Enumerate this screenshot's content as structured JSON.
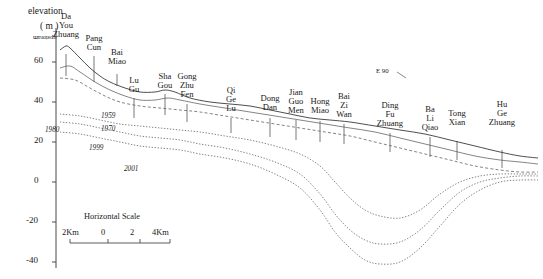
{
  "figure": {
    "type": "hydrogeological-cross-section",
    "axis": {
      "y_title_line1": "elevation",
      "y_title_line2": "( m )",
      "y_ticks": [
        60,
        40,
        20,
        0,
        -20,
        -40
      ],
      "y_tick_labels": [
        "60",
        "40",
        "20",
        "0",
        "-20",
        "-40"
      ],
      "ylim": [
        -45,
        72
      ]
    },
    "upstream_marker": "upstream",
    "annotation": "E 90",
    "scale_bar": {
      "title": "Horizontal Scale",
      "labels": [
        "2Km",
        "0",
        "2",
        "4Km"
      ]
    },
    "sites": [
      {
        "name": "Da\nYou\nZhuang",
        "x": 66,
        "label_y": 12,
        "tick_top": 54,
        "tick_bottom": 76
      },
      {
        "name": "Pang\nCun",
        "x": 94,
        "label_y": 34,
        "tick_top": 56,
        "tick_bottom": 82
      },
      {
        "name": "Bai\nMiao",
        "x": 117,
        "label_y": 48,
        "tick_top": 74,
        "tick_bottom": 86
      },
      {
        "name": "Lu\nGu",
        "x": 134,
        "label_y": 76,
        "tick_top": 98,
        "tick_bottom": 118
      },
      {
        "name": "Sha\nGou",
        "x": 165,
        "label_y": 72,
        "tick_top": 94,
        "tick_bottom": 115
      },
      {
        "name": "Gong\nZhu\nFen",
        "x": 187,
        "label_y": 72,
        "tick_top": 104,
        "tick_bottom": 122
      },
      {
        "name": "Qi\nGe\nLu",
        "x": 231,
        "label_y": 86,
        "tick_top": 118,
        "tick_bottom": 133
      },
      {
        "name": "Dong\nDan",
        "x": 270,
        "label_y": 94,
        "tick_top": 118,
        "tick_bottom": 137
      },
      {
        "name": "Jian\nGuo\nMen",
        "x": 296,
        "label_y": 88,
        "tick_top": 120,
        "tick_bottom": 140
      },
      {
        "name": "Hong\nMiao",
        "x": 320,
        "label_y": 97,
        "tick_top": 121,
        "tick_bottom": 142
      },
      {
        "name": "Bai\nZi\nWan",
        "x": 344,
        "label_y": 92,
        "tick_top": 124,
        "tick_bottom": 144
      },
      {
        "name": "Ding\nFu\nZhuang",
        "x": 390,
        "label_y": 101,
        "tick_top": 133,
        "tick_bottom": 152
      },
      {
        "name": "Ba\nLi\nQiao",
        "x": 430,
        "label_y": 105,
        "tick_top": 137,
        "tick_bottom": 157
      },
      {
        "name": "Tong\nXian",
        "x": 457,
        "label_y": 109,
        "tick_top": 141,
        "tick_bottom": 160
      },
      {
        "name": "Hu\nGe\nZhuang",
        "x": 502,
        "label_y": 100,
        "tick_top": 150,
        "tick_bottom": 168
      }
    ],
    "curve_labels": [
      {
        "text": "1959",
        "x": 101,
        "y": 113
      },
      {
        "text": "1970",
        "x": 101,
        "y": 126
      },
      {
        "text": "1980",
        "x": 45,
        "y": 127
      },
      {
        "text": "1999",
        "x": 89,
        "y": 145
      },
      {
        "text": "2001",
        "x": 124,
        "y": 166
      }
    ]
  },
  "chart_data": {
    "type": "line",
    "xlabel": "Distance along transect (Km)",
    "ylabel": "elevation ( m )",
    "ylim": [
      -45,
      72
    ],
    "grid": false,
    "legend": "inline curve labels",
    "x_categories": [
      "Da You Zhuang",
      "Pang Cun",
      "Bai Miao",
      "Lu Gu",
      "Sha Gou",
      "Gong Zhu Fen",
      "Qi Ge Lu",
      "Dong Dan",
      "Jian Guo Men",
      "Hong Miao",
      "Bai Zi Wan",
      "Ding Fu Zhuang",
      "Ba Li Qiao",
      "Tong Xian",
      "Hu Ge Zhuang"
    ],
    "series": [
      {
        "name": "ground surface",
        "style": "solid",
        "points": [
          [
            60,
            66
          ],
          [
            66,
            68
          ],
          [
            70,
            67
          ],
          [
            80,
            62
          ],
          [
            90,
            57
          ],
          [
            100,
            53
          ],
          [
            110,
            50
          ],
          [
            125,
            47
          ],
          [
            140,
            45
          ],
          [
            155,
            45
          ],
          [
            165,
            46
          ],
          [
            175,
            45
          ],
          [
            190,
            42
          ],
          [
            210,
            40
          ],
          [
            230,
            39
          ],
          [
            250,
            38
          ],
          [
            270,
            36
          ],
          [
            290,
            34
          ],
          [
            310,
            32
          ],
          [
            330,
            31
          ],
          [
            350,
            30
          ],
          [
            375,
            28
          ],
          [
            400,
            26
          ],
          [
            425,
            24
          ],
          [
            450,
            21
          ],
          [
            475,
            18
          ],
          [
            500,
            15
          ],
          [
            520,
            13
          ],
          [
            538,
            12
          ]
        ]
      },
      {
        "name": "1959",
        "style": "solid",
        "points": [
          [
            60,
            57
          ],
          [
            70,
            58
          ],
          [
            80,
            55
          ],
          [
            95,
            50
          ],
          [
            110,
            46
          ],
          [
            125,
            43
          ],
          [
            140,
            41
          ],
          [
            155,
            41
          ],
          [
            168,
            42
          ],
          [
            180,
            41
          ],
          [
            200,
            39
          ],
          [
            225,
            37
          ],
          [
            250,
            35
          ],
          [
            275,
            33
          ],
          [
            300,
            31
          ],
          [
            325,
            29
          ],
          [
            350,
            27
          ],
          [
            375,
            25
          ],
          [
            400,
            22
          ],
          [
            425,
            19
          ],
          [
            450,
            16
          ],
          [
            475,
            13
          ],
          [
            500,
            11
          ],
          [
            520,
            10
          ],
          [
            538,
            9
          ]
        ]
      },
      {
        "name": "1970",
        "style": "dashed",
        "points": [
          [
            60,
            52
          ],
          [
            75,
            51
          ],
          [
            90,
            47
          ],
          [
            105,
            43
          ],
          [
            120,
            40
          ],
          [
            140,
            38
          ],
          [
            160,
            37
          ],
          [
            180,
            36
          ],
          [
            200,
            35
          ],
          [
            225,
            33
          ],
          [
            250,
            31
          ],
          [
            275,
            29
          ],
          [
            300,
            27
          ],
          [
            325,
            25
          ],
          [
            350,
            23
          ],
          [
            375,
            20
          ],
          [
            400,
            17
          ],
          [
            425,
            14
          ],
          [
            450,
            11
          ],
          [
            475,
            8
          ],
          [
            500,
            6
          ],
          [
            520,
            5
          ],
          [
            538,
            5
          ]
        ]
      },
      {
        "name": "1980",
        "style": "dashed",
        "points": [
          [
            60,
            34
          ],
          [
            80,
            33
          ],
          [
            100,
            31
          ],
          [
            120,
            29
          ],
          [
            140,
            28
          ],
          [
            160,
            27
          ],
          [
            180,
            26
          ],
          [
            200,
            25
          ],
          [
            225,
            23
          ],
          [
            250,
            21
          ],
          [
            275,
            18
          ],
          [
            300,
            14
          ],
          [
            320,
            8
          ],
          [
            335,
            0
          ],
          [
            350,
            -8
          ],
          [
            365,
            -14
          ],
          [
            380,
            -17
          ],
          [
            400,
            -18
          ],
          [
            420,
            -14
          ],
          [
            440,
            -6
          ],
          [
            460,
            0
          ],
          [
            480,
            3
          ],
          [
            500,
            4
          ],
          [
            520,
            4
          ],
          [
            538,
            4
          ]
        ]
      },
      {
        "name": "1999",
        "style": "dashed",
        "points": [
          [
            60,
            30
          ],
          [
            80,
            29
          ],
          [
            100,
            27
          ],
          [
            120,
            25
          ],
          [
            140,
            23
          ],
          [
            160,
            22
          ],
          [
            180,
            21
          ],
          [
            200,
            19
          ],
          [
            225,
            17
          ],
          [
            250,
            14
          ],
          [
            275,
            10
          ],
          [
            300,
            4
          ],
          [
            320,
            -6
          ],
          [
            335,
            -16
          ],
          [
            350,
            -24
          ],
          [
            365,
            -29
          ],
          [
            380,
            -31
          ],
          [
            400,
            -30
          ],
          [
            420,
            -24
          ],
          [
            440,
            -14
          ],
          [
            460,
            -5
          ],
          [
            480,
            0
          ],
          [
            500,
            2
          ],
          [
            520,
            3
          ],
          [
            538,
            3
          ]
        ]
      },
      {
        "name": "2001",
        "style": "dashed",
        "points": [
          [
            60,
            25
          ],
          [
            80,
            24
          ],
          [
            100,
            22
          ],
          [
            120,
            20
          ],
          [
            140,
            18
          ],
          [
            160,
            17
          ],
          [
            180,
            16
          ],
          [
            200,
            14
          ],
          [
            225,
            12
          ],
          [
            250,
            9
          ],
          [
            275,
            4
          ],
          [
            300,
            -3
          ],
          [
            320,
            -14
          ],
          [
            335,
            -25
          ],
          [
            350,
            -33
          ],
          [
            365,
            -39
          ],
          [
            380,
            -41
          ],
          [
            400,
            -40
          ],
          [
            420,
            -33
          ],
          [
            440,
            -22
          ],
          [
            460,
            -11
          ],
          [
            480,
            -4
          ],
          [
            500,
            0
          ],
          [
            520,
            1
          ],
          [
            538,
            1
          ]
        ]
      }
    ]
  }
}
